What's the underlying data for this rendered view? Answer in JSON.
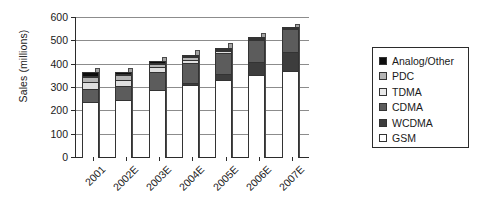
{
  "chart_data": {
    "type": "bar",
    "stacked": true,
    "title": "",
    "xlabel": "",
    "ylabel": "Sales (millions)",
    "ylim": [
      0,
      600
    ],
    "ytick_step": 100,
    "yticks": [
      "0",
      "100",
      "200",
      "300",
      "400",
      "500",
      "600"
    ],
    "grid": true,
    "legend_position": "right",
    "categories": [
      "2001",
      "2002E",
      "2003E",
      "2004E",
      "2005E",
      "2006E",
      "2007E"
    ],
    "series": [
      {
        "name": "GSM",
        "color": "#ffffff",
        "values": [
          240,
          250,
          290,
          315,
          335,
          355,
          375
        ]
      },
      {
        "name": "WCDMA",
        "color": "#3d3d3d",
        "values": [
          0,
          0,
          0,
          10,
          30,
          60,
          85
        ]
      },
      {
        "name": "CDMA",
        "color": "#5c5c5c",
        "values": [
          60,
          65,
          85,
          90,
          95,
          100,
          100
        ]
      },
      {
        "name": "TDMA",
        "color": "#e0e0e0",
        "values": [
          35,
          30,
          25,
          18,
          10,
          5,
          3
        ]
      },
      {
        "name": "PDC",
        "color": "#b5b5b5",
        "values": [
          25,
          25,
          18,
          17,
          12,
          6,
          4
        ]
      },
      {
        "name": "Analog/Other",
        "color": "#0d0d0d",
        "values": [
          20,
          13,
          10,
          10,
          8,
          4,
          3
        ]
      }
    ],
    "totals": [
      380,
      383,
      428,
      460,
      490,
      530,
      570
    ]
  },
  "legend": {
    "items": [
      {
        "label": "Analog/Other",
        "color": "#0d0d0d"
      },
      {
        "label": "PDC",
        "color": "#b5b5b5"
      },
      {
        "label": "TDMA",
        "color": "#e8e8e8"
      },
      {
        "label": "CDMA",
        "color": "#5c5c5c"
      },
      {
        "label": "WCDMA",
        "color": "#3d3d3d"
      },
      {
        "label": "GSM",
        "color": "#ffffff"
      }
    ]
  }
}
